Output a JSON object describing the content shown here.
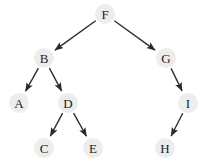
{
  "diagram": {
    "type": "directed-tree",
    "canvas": {
      "width": 204,
      "height": 164,
      "background": "#ffffff"
    },
    "style": {
      "node_fill": "#ededed",
      "node_radius": 10,
      "label_color": "#1c1c1c",
      "edge_color": "#2a2a2a",
      "edge_width": 1.35,
      "arrowhead": "filled-triangle"
    },
    "root": "F",
    "nodes": [
      {
        "id": "F",
        "label": "F",
        "x": 105,
        "y": 14
      },
      {
        "id": "B",
        "label": "B",
        "x": 44,
        "y": 58
      },
      {
        "id": "G",
        "label": "G",
        "x": 166,
        "y": 58
      },
      {
        "id": "A",
        "label": "A",
        "x": 19,
        "y": 103
      },
      {
        "id": "D",
        "label": "D",
        "x": 68,
        "y": 103
      },
      {
        "id": "I",
        "label": "I",
        "x": 188,
        "y": 103
      },
      {
        "id": "C",
        "label": "C",
        "x": 44,
        "y": 148
      },
      {
        "id": "E",
        "label": "E",
        "x": 93,
        "y": 148
      },
      {
        "id": "H",
        "label": "H",
        "x": 165,
        "y": 148
      }
    ],
    "edges": [
      {
        "from": "F",
        "to": "B",
        "directed": true
      },
      {
        "from": "F",
        "to": "G",
        "directed": true
      },
      {
        "from": "B",
        "to": "A",
        "directed": true
      },
      {
        "from": "B",
        "to": "D",
        "directed": true
      },
      {
        "from": "D",
        "to": "C",
        "directed": true
      },
      {
        "from": "D",
        "to": "E",
        "directed": true
      },
      {
        "from": "G",
        "to": "I",
        "directed": true
      },
      {
        "from": "I",
        "to": "H",
        "directed": true
      }
    ]
  }
}
